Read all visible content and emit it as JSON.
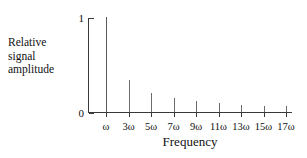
{
  "chart_data": {
    "type": "bar",
    "title": "",
    "subtitle": "",
    "xlabel": "Frequency",
    "ylabel": "Relative signal amplitude",
    "ylabel_lines": [
      "Relative",
      "signal",
      "amplitude"
    ],
    "categories": [
      "ω",
      "3ω",
      "5ω",
      "7ω",
      "9ω",
      "11ω",
      "13ω",
      "15ω",
      "17ω"
    ],
    "values": [
      1.0,
      0.333,
      0.2,
      0.143,
      0.111,
      0.091,
      0.077,
      0.067,
      0.059
    ],
    "ylim": [
      0,
      1
    ],
    "xlim_note": "harmonic index 1 to 17, odd harmonics only",
    "ytick_values": [
      0,
      1
    ],
    "ytick_labels": [
      "0",
      "1"
    ],
    "grid": false,
    "legend": false,
    "legend_position": "none",
    "series": [
      {
        "name": "Relative signal amplitude",
        "values": [
          1.0,
          0.333,
          0.2,
          0.143,
          0.111,
          0.091,
          0.077,
          0.067,
          0.059
        ]
      }
    ],
    "colors": {
      "axis": "#3a3a3a",
      "stem": "#6b6b6b",
      "text": "#111111",
      "background": "#ffffff"
    }
  }
}
